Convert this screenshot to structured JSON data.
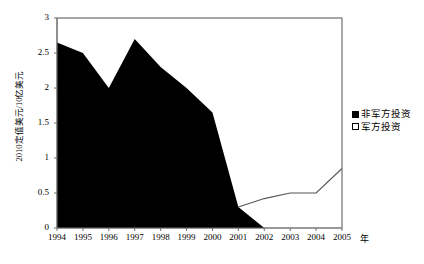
{
  "chart_data": {
    "type": "area",
    "title": "",
    "xlabel": "年",
    "ylabel": "2010定值美元/10亿美元",
    "categories": [
      "1994",
      "1995",
      "1996",
      "1997",
      "1998",
      "1999",
      "2000",
      "2001",
      "2002",
      "2003",
      "2004",
      "2005"
    ],
    "x": [
      1994,
      1995,
      1996,
      1997,
      1998,
      1999,
      2000,
      2001,
      2002,
      2003,
      2004,
      2005
    ],
    "xlim": [
      1994,
      2005
    ],
    "ylim": [
      0,
      3
    ],
    "yticks": [
      "0",
      "0.5",
      "1",
      "1.5",
      "2",
      "2.5",
      "3"
    ],
    "ytick_values": [
      0,
      0.5,
      1,
      1.5,
      2,
      2.5,
      3
    ],
    "grid": false,
    "legend_position": "right",
    "series": [
      {
        "name": "非军方投资",
        "style": "area",
        "fill": "#000000",
        "values": [
          2.65,
          2.5,
          2.0,
          2.7,
          2.3,
          2.0,
          1.65,
          0.3,
          0.0,
          0.0,
          0.0,
          0.0
        ]
      },
      {
        "name": "军方投资",
        "style": "line",
        "fill": "#FFFFFF",
        "stroke": "#444444",
        "values": [
          null,
          null,
          null,
          null,
          null,
          null,
          null,
          0.3,
          0.42,
          0.5,
          0.5,
          0.85
        ]
      }
    ]
  },
  "axes": {
    "y_title": "2010定值美元/10亿美元",
    "x_unit": "年",
    "y_ticks": [
      "3",
      "2.5",
      "2",
      "1.5",
      "1",
      "0.5",
      "0"
    ],
    "x_ticks": [
      "1994",
      "1995",
      "1996",
      "1997",
      "1998",
      "1999",
      "2000",
      "2001",
      "2002",
      "2003",
      "2004",
      "2005"
    ]
  },
  "legend": {
    "items": [
      {
        "label": "非军方投资",
        "marker": "filled-square"
      },
      {
        "label": "军方投资",
        "marker": "hollow-square"
      }
    ]
  },
  "colors": {
    "area_fill": "#000000",
    "line_stroke": "#555555",
    "axis": "#808080",
    "text": "#000000",
    "background": "#FFFFFF"
  }
}
